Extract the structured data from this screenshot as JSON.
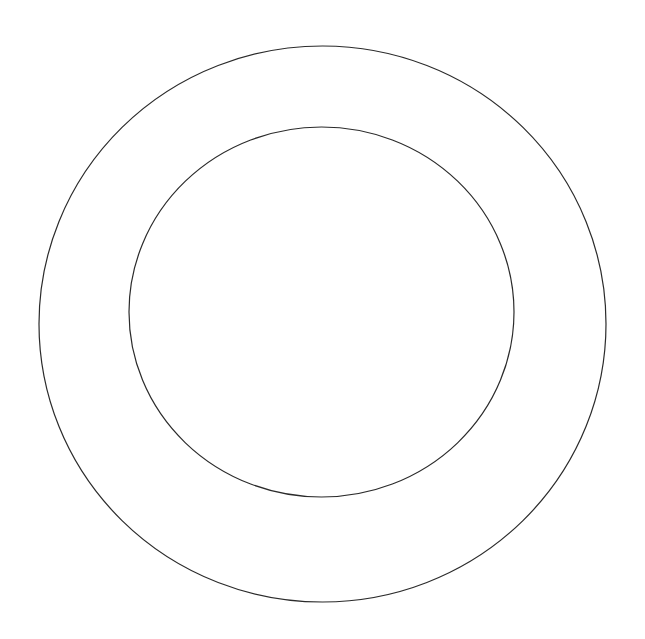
{
  "canvas": {
    "width": 645,
    "height": 639,
    "background_color": "#ffffff",
    "title": "Concentric Rings Line Drawing"
  },
  "drawing": {
    "type": "line-drawing",
    "subject": "plate",
    "description": "Two concentric ellipse outlines forming an annular ring, drawn as thin dark contour lines on a plain white background",
    "stroke_color": "#2b2b2b",
    "stroke_width": 1.2,
    "fill": "none",
    "shapes": [
      {
        "name": "outer-rim",
        "kind": "ellipse",
        "cx": 322.5,
        "cy": 324.0,
        "rx": 283.5,
        "ry": 278.0,
        "stroke_color": "#2b2b2b",
        "stroke_width": 1.2,
        "bounds": {
          "left": 39,
          "top": 46,
          "right": 606,
          "bottom": 602
        }
      },
      {
        "name": "inner-well",
        "kind": "ellipse",
        "cx": 321.5,
        "cy": 312.0,
        "rx": 192.5,
        "ry": 185.0,
        "stroke_color": "#2b2b2b",
        "stroke_width": 1.2,
        "bounds": {
          "left": 129,
          "top": 127,
          "right": 514,
          "bottom": 497
        }
      }
    ]
  }
}
